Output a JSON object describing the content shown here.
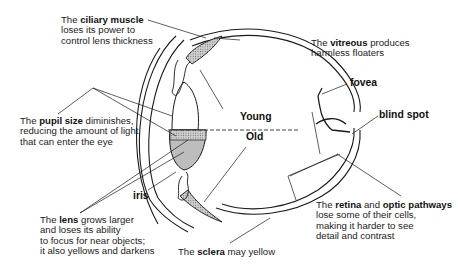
{
  "diagram": {
    "annotations": {
      "ciliary_muscle": {
        "pre": "The ",
        "bold": "ciliary muscle",
        "line2": "loses its power to",
        "line3": "control lens thickness"
      },
      "vitreous": {
        "pre": "The ",
        "bold": "vitreous",
        "post": " produces",
        "line2": "harmless floaters"
      },
      "pupil_size": {
        "pre": "The ",
        "bold": "pupil size",
        "post": " diminishes,",
        "line2": "reducing the amount of light",
        "line3": "that can enter the eye"
      },
      "lens": {
        "pre": "The ",
        "bold": "lens",
        "post": " grows larger",
        "line2": "and loses its ability",
        "line3": "to focus for near objects;",
        "line4": "it also yellows and darkens"
      },
      "sclera": {
        "pre": "The ",
        "bold": "sclera",
        "post": " may yellow"
      },
      "retina": {
        "pre": "The ",
        "bold1": "retina",
        "mid": " and ",
        "bold2": "optic pathways",
        "line2": "lose some of their cells,",
        "line3": "making it harder to see",
        "line4": "detail and contrast"
      }
    },
    "tags": {
      "young": "Young",
      "old": "Old",
      "fovea": "fovea",
      "blind_spot": "blind spot",
      "iris": "iris"
    },
    "colors": {
      "line": "#1a1a1a",
      "shade": "#bdbdbd",
      "background": "#ffffff"
    }
  }
}
